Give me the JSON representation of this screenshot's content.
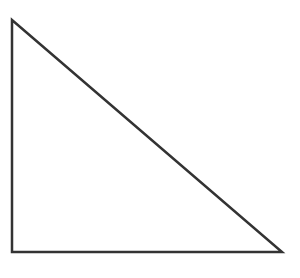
{
  "figure": {
    "name": "right-triangle",
    "canvas": {
      "width": 300,
      "height": 278,
      "background_color": "#ffffff"
    },
    "shape": {
      "type": "triangle",
      "variant": "right-triangle",
      "right_angle_at": "bottom-left",
      "fill": "none",
      "stroke_color": "#333333",
      "stroke_width": 2.5,
      "stroke_linejoin": "miter",
      "vertices": [
        {
          "label": "apex",
          "x": 12,
          "y": 20
        },
        {
          "label": "bottom-left",
          "x": 12,
          "y": 252
        },
        {
          "label": "bottom-right",
          "x": 282,
          "y": 252
        }
      ],
      "edges": [
        {
          "label": "vertical-leg",
          "from": "apex",
          "to": "bottom-left",
          "length": 232
        },
        {
          "label": "horizontal-leg",
          "from": "bottom-left",
          "to": "bottom-right",
          "length": 270
        },
        {
          "label": "hypotenuse",
          "from": "apex",
          "to": "bottom-right",
          "length": 355
        }
      ],
      "points_attribute": "12,20 12,252 282,252"
    }
  }
}
